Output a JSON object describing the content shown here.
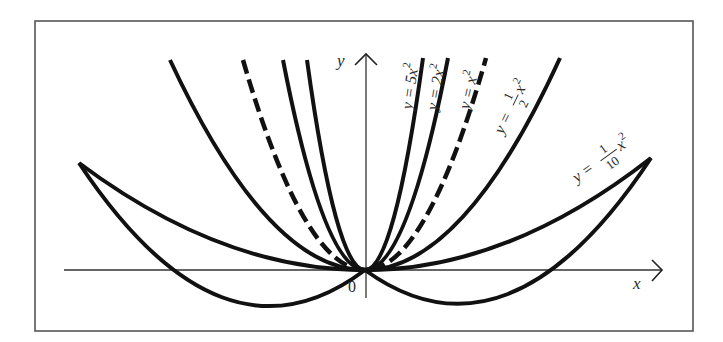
{
  "figure": {
    "frame": {
      "x": 35,
      "y": 21,
      "width": 658,
      "height": 310,
      "stroke": "#555555"
    },
    "origin": {
      "px": 365,
      "py": 270
    },
    "axes": {
      "x": {
        "label": "x",
        "from_px": 64,
        "to_px": 662
      },
      "y": {
        "label": "y",
        "from_py": 298,
        "to_py": 54
      },
      "origin_label": "0"
    },
    "curve_color": "#111111",
    "curves": [
      {
        "id": "tenth",
        "label_prefix": "y = ",
        "coef_num": "1",
        "coef_den": "10",
        "label_suffix": "x",
        "exp": "2",
        "coefficient": 0.1,
        "style": "solid",
        "left_end": [
          79,
          163
        ],
        "right_end": [
          651,
          158
        ]
      },
      {
        "id": "half",
        "label_prefix": "y = ",
        "coef_num": "1",
        "coef_den": "2",
        "label_suffix": "x",
        "exp": "2",
        "coefficient": 0.5,
        "style": "solid",
        "left_end": [
          170,
          60
        ],
        "right_end": [
          560,
          58
        ]
      },
      {
        "id": "one",
        "label": "y = x",
        "exp": "2",
        "coefficient": 1,
        "style": "dashed",
        "left_end": [
          243,
          60
        ],
        "right_end": [
          486,
          58
        ]
      },
      {
        "id": "two",
        "label": "y = 2x",
        "exp": "2",
        "coefficient": 2,
        "style": "solid",
        "left_end": [
          283,
          60
        ],
        "right_end": [
          448,
          58
        ]
      },
      {
        "id": "five",
        "label": "y = 5x",
        "exp": "2",
        "coefficient": 5,
        "style": "solid",
        "left_end": [
          307,
          60
        ],
        "right_end": [
          423,
          58
        ]
      }
    ]
  }
}
